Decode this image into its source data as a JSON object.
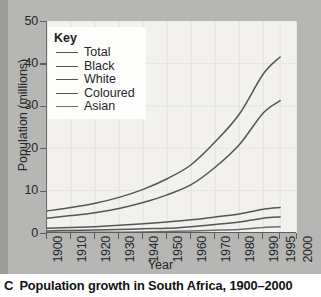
{
  "caption": {
    "letter": "C",
    "text": "Population growth in South Africa, 1900–2000"
  },
  "legend": {
    "title": "Key",
    "items": [
      {
        "label": "Total"
      },
      {
        "label": "Black"
      },
      {
        "label": "White"
      },
      {
        "label": "Coloured"
      },
      {
        "label": "Asian"
      }
    ]
  },
  "chart_data": {
    "type": "line",
    "title": "Population growth in South Africa, 1900–2000",
    "xlabel": "Year",
    "ylabel": "Population (millions)",
    "xlim": [
      1900,
      2000
    ],
    "ylim": [
      0,
      50
    ],
    "ytick_labels": [
      "0",
      "10",
      "20",
      "30",
      "40",
      "50"
    ],
    "yticks": [
      0,
      10,
      20,
      30,
      40,
      50
    ],
    "xtick_labels": [
      "1900",
      "1910",
      "1920",
      "1930",
      "1940",
      "1950",
      "1960",
      "1970",
      "1980",
      "1990",
      "1995",
      "2000"
    ],
    "xticks": [
      1900,
      1910,
      1920,
      1930,
      1940,
      1950,
      1960,
      1970,
      1980,
      1990,
      1995,
      2000
    ],
    "grid": true,
    "legend_position": "top-left",
    "x": [
      1900,
      1910,
      1920,
      1930,
      1940,
      1950,
      1960,
      1970,
      1980,
      1990,
      1995
    ],
    "series": [
      {
        "name": "Total",
        "color": "#555553",
        "values": [
          5.2,
          6.0,
          7.0,
          8.4,
          10.3,
          12.8,
          16.1,
          21.5,
          28.0,
          37.5,
          41.5
        ]
      },
      {
        "name": "Black",
        "color": "#555553",
        "values": [
          3.5,
          4.1,
          4.8,
          5.8,
          7.2,
          9.0,
          11.4,
          15.5,
          20.8,
          28.3,
          31.2
        ]
      },
      {
        "name": "White",
        "color": "#555553",
        "values": [
          1.1,
          1.3,
          1.5,
          1.8,
          2.2,
          2.6,
          3.1,
          3.8,
          4.5,
          5.6,
          6.0
        ]
      },
      {
        "name": "Coloured",
        "color": "#555553",
        "values": [
          0.5,
          0.6,
          0.7,
          0.8,
          1.0,
          1.1,
          1.5,
          2.0,
          2.6,
          3.5,
          3.8
        ]
      },
      {
        "name": "Asian",
        "color": "#6d6d6b",
        "values": [
          0.15,
          0.15,
          0.17,
          0.2,
          0.25,
          0.37,
          0.5,
          0.65,
          0.85,
          1.3,
          1.5
        ]
      }
    ]
  }
}
